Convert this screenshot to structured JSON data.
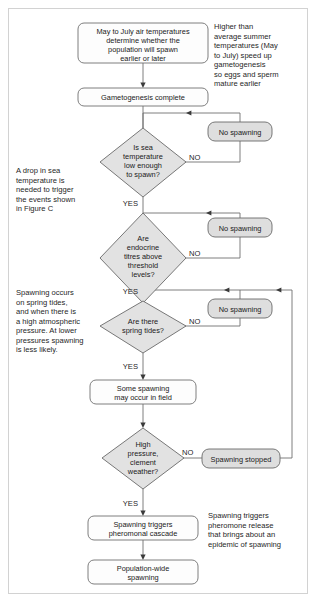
{
  "figure": {
    "border_color": "#d2d2d2",
    "background_color": "#ffffff",
    "decision_fill": "#e2e2e2",
    "terminal_fill": "#dedede",
    "process_fill": "#fdfdfd",
    "line_color": "#6f6f6f"
  },
  "nodes": {
    "air_temperature": {
      "type": "process",
      "lines": [
        "May to July air temperatures",
        "determine whether the",
        "population will spawn",
        "earlier or later"
      ]
    },
    "gametogenesis": {
      "type": "process",
      "lines": [
        "Gametogenesis complete"
      ]
    },
    "sea_temp_decision": {
      "type": "decision",
      "lines": [
        "Is sea",
        "temperature",
        "low enough",
        "to spawn?"
      ]
    },
    "endocrine_decision": {
      "type": "decision",
      "lines": [
        "Are",
        "endocrine",
        "titres above",
        "threshold",
        "levels?"
      ]
    },
    "spring_tides_decision": {
      "type": "decision",
      "lines": [
        "Are there",
        "spring tides?"
      ]
    },
    "pressure_decision": {
      "type": "decision",
      "lines": [
        "High",
        "pressure,",
        "clement",
        "weather?"
      ]
    },
    "no_spawning_1": {
      "type": "terminal",
      "lines": [
        "No spawning"
      ]
    },
    "no_spawning_2": {
      "type": "terminal",
      "lines": [
        "No spawning"
      ]
    },
    "no_spawning_3": {
      "type": "terminal",
      "lines": [
        "No spawning"
      ]
    },
    "spawning_stopped": {
      "type": "terminal",
      "lines": [
        "Spawning stopped"
      ]
    },
    "some_spawning": {
      "type": "process",
      "lines": [
        "Some spawning",
        "may occur in field"
      ]
    },
    "pheromonal_cascade": {
      "type": "process",
      "lines": [
        "Spawning triggers",
        "pheromonal cascade"
      ]
    },
    "population_spawning": {
      "type": "process",
      "lines": [
        "Population-wide",
        "spawning"
      ]
    }
  },
  "edge_labels": {
    "no_1": "NO",
    "no_2": "NO",
    "no_3": "NO",
    "no_4": "NO",
    "yes_1": "YES",
    "yes_2": "YES",
    "yes_3": "YES",
    "yes_4": "YES"
  },
  "notes": {
    "top_right": [
      "Higher than",
      "average summer",
      "temperatures (May",
      "to July) speed up",
      "gametogenesis",
      "so eggs and sperm",
      "mature earlier"
    ],
    "left_upper": [
      "A drop in sea",
      "temperature is",
      "needed to trigger",
      "the events shown",
      "in Figure C"
    ],
    "left_lower": [
      "Spawning occurs",
      "on spring tides,",
      "and when there is",
      "a high atmospheric",
      "pressure. At lower",
      "pressures spawning",
      "is less likely."
    ],
    "bottom_right": [
      "Spawning triggers",
      "pheromone release",
      "that brings about an",
      "epidemic of spawning"
    ]
  }
}
